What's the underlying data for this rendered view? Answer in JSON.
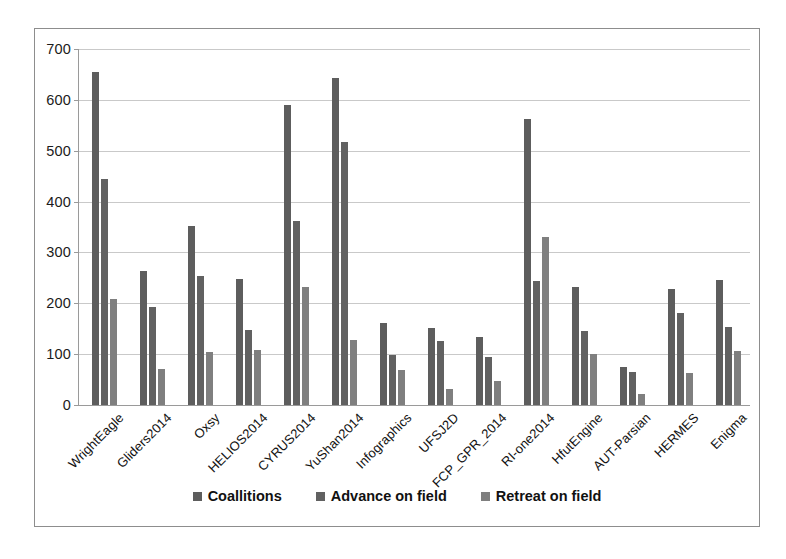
{
  "chart_data": {
    "type": "bar",
    "title": "",
    "xlabel": "",
    "ylabel": "",
    "ylim": [
      0,
      700
    ],
    "ytick_step": 100,
    "yticks": [
      0,
      100,
      200,
      300,
      400,
      500,
      600,
      700
    ],
    "ytick_labels": [
      "0",
      "100",
      "200",
      "300",
      "400",
      "500",
      "600",
      "700"
    ],
    "grid": true,
    "legend_position": "bottom",
    "categories": [
      "WrightEagle",
      "Gliders2014",
      "Oxsy",
      "HELIOS2014",
      "CYRUS2014",
      "YuShan2014",
      "Infographics",
      "UFSJ2D",
      "FCP_GPR_2014",
      "RI-one2014",
      "HfutEngine",
      "AUT-Parsian",
      "HERMES",
      "Enigma"
    ],
    "series": [
      {
        "name": "Coallitions",
        "color": "#5d5d5d",
        "values": [
          655,
          263,
          352,
          248,
          590,
          643,
          161,
          152,
          133,
          562,
          232,
          75,
          228,
          245
        ]
      },
      {
        "name": "Advance on field",
        "color": "#616161",
        "values": [
          445,
          193,
          253,
          147,
          362,
          518,
          98,
          125,
          95,
          243,
          145,
          65,
          180,
          153
        ]
      },
      {
        "name": "Retreat on field",
        "color": "#7f7f7f",
        "values": [
          209,
          70,
          105,
          108,
          232,
          127,
          68,
          32,
          47,
          330,
          100,
          22,
          62,
          107
        ]
      }
    ]
  },
  "legend": {
    "entries": [
      {
        "label": "Coallitions"
      },
      {
        "label": "Advance on field"
      },
      {
        "label": "Retreat on field"
      }
    ]
  },
  "axes": {
    "y_max_label": "700",
    "y_min_label": "0"
  }
}
